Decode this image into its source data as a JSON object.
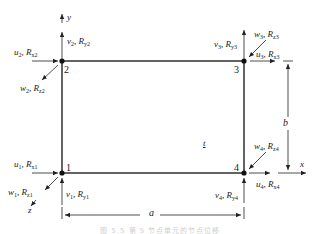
{
  "diagram": {
    "type": "rectangular-plate-element",
    "axes": {
      "x": "x",
      "y": "y",
      "z": "z"
    },
    "dimensions": {
      "width": "a",
      "height": "b"
    },
    "thickness_label": "t",
    "nodes": [
      {
        "id": "1",
        "u": "u",
        "v": "v",
        "w": "w",
        "idx": "1",
        "Rx": "R",
        "Ry": "R",
        "Rz": "R",
        "sx": "x1",
        "sy": "y1",
        "sz": "z1"
      },
      {
        "id": "2",
        "u": "u",
        "v": "v",
        "w": "w",
        "idx": "2",
        "Rx": "R",
        "Ry": "R",
        "Rz": "R",
        "sx": "x2",
        "sy": "y2",
        "sz": "z2"
      },
      {
        "id": "3",
        "u": "u",
        "v": "v",
        "w": "w",
        "idx": "3",
        "Rx": "R",
        "Ry": "R",
        "Rz": "R",
        "sx": "x3",
        "sy": "y3",
        "sz": "z3"
      },
      {
        "id": "4",
        "u": "u",
        "v": "v",
        "w": "w",
        "idx": "4",
        "Rx": "R",
        "Ry": "R",
        "Rz": "R",
        "sx": "x4",
        "sy": "y4",
        "sz": "z4"
      }
    ],
    "caption": "图 5.5  第 5 节点单元的节点位移",
    "colors": {
      "line": "#222222",
      "caption": "#cfcfcf"
    }
  }
}
